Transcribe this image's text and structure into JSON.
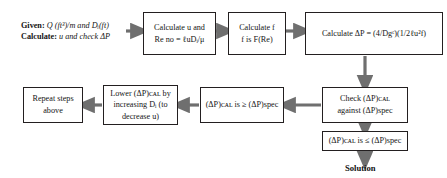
{
  "diagram": {
    "colors": {
      "box_border": "#231f20",
      "arrow": "#6f6f6f",
      "text": "#151515",
      "background": "#ffffff"
    },
    "intro": {
      "line1_label": "Given:",
      "line1_text": "Q (ft³)/m and Dᵢ(ft)",
      "line2_label": "Calculate:",
      "line2_text": "u and check ΔP"
    },
    "nodes": [
      {
        "id": "calc-u-re",
        "lines": [
          "Calculate u and",
          "Re no = ℓuDᵢ/μ"
        ]
      },
      {
        "id": "calc-f",
        "lines": [
          "Calculate f",
          "f is F(Re)"
        ]
      },
      {
        "id": "calc-delta-p",
        "lines": [
          "Calculate ΔP = (4/Dgᶜ)(1/2ℓu²f)"
        ]
      },
      {
        "id": "check-delta-p",
        "lines": [
          "Check (ΔP)ᴄᴀʟ",
          "against (ΔP)spec"
        ]
      },
      {
        "id": "delta-p-ge-spec",
        "lines": [
          "(ΔP)ᴄᴀʟ is ≥ (ΔP)spec"
        ]
      },
      {
        "id": "lower-delta-p",
        "lines": [
          "Lower (ΔP)ᴄᴀʟ by",
          "increasing Dᵢ (to",
          "decrease u)"
        ]
      },
      {
        "id": "repeat-steps",
        "lines": [
          "Repeat steps",
          "above"
        ]
      },
      {
        "id": "delta-p-le-spec",
        "lines": [
          "(ΔP)ᴄᴀʟ is ≤ (ΔP)spec"
        ]
      }
    ],
    "result_label": "Solution",
    "subscripts": {
      "cal": "cal",
      "spec": "spec",
      "i": "i",
      "c": "c"
    },
    "symbols": {
      "delta_p": "ΔP",
      "ge": "≥",
      "le": "≤",
      "mu": "μ",
      "ell": "ℓ"
    }
  }
}
